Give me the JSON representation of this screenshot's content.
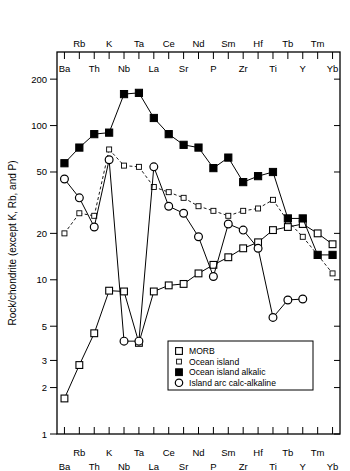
{
  "chart_data": {
    "type": "line",
    "title": "",
    "subtitle": "",
    "xlabel": "",
    "ylabel": "Rock/chondrite (except K, Rb, and P)",
    "yscale": "log",
    "ylim": [
      1,
      300
    ],
    "ytick_values": [
      1,
      2,
      3,
      5,
      10,
      20,
      50,
      100,
      200
    ],
    "ytick_labels": [
      "1",
      "2",
      "3",
      "5",
      "10",
      "20",
      "50",
      "100",
      "200"
    ],
    "grid": false,
    "legend_position": "bottom-right",
    "categories": [
      "Ba",
      "Rb",
      "Th",
      "K",
      "Nb",
      "Ta",
      "La",
      "Ce",
      "Sr",
      "Nd",
      "P",
      "Sm",
      "Zr",
      "Hf",
      "Ti",
      "Tb",
      "Y",
      "Tm",
      "Yb"
    ],
    "top_axis_labels": [
      "",
      "Rb",
      "",
      "K",
      "",
      "Ta",
      "",
      "Ce",
      "",
      "Nd",
      "",
      "Sm",
      "",
      "Hf",
      "",
      "Tb",
      "",
      "Tm",
      ""
    ],
    "bottom_axis_labels": [
      "Ba",
      "",
      "Th",
      "",
      "Nb",
      "",
      "La",
      "",
      "Sr",
      "",
      "P",
      "",
      "Zr",
      "",
      "Ti",
      "",
      "Y",
      "",
      "Yb"
    ],
    "series": [
      {
        "name": "MORB",
        "marker": "open-square",
        "line": "solid",
        "values": [
          1.7,
          2.8,
          4.5,
          8.5,
          8.4,
          3.9,
          8.4,
          9.2,
          9.4,
          11.0,
          12.5,
          14.0,
          16.0,
          17.5,
          21.0,
          22.0,
          23.0,
          20.0,
          17.0
        ]
      },
      {
        "name": "Ocean island",
        "marker": "small-open-square",
        "line": "dashed",
        "values": [
          20.0,
          27.0,
          26.0,
          70.0,
          55.0,
          54.0,
          40.0,
          37.0,
          34.0,
          30.0,
          28.0,
          26.0,
          28.0,
          29.0,
          33.0,
          24.0,
          19.0,
          14.5,
          11.0
        ]
      },
      {
        "name": "Ocean island alkalic",
        "marker": "filled-square",
        "line": "solid",
        "values": [
          57.0,
          72.0,
          88.0,
          90.0,
          160.0,
          163.0,
          112.0,
          88.0,
          75.0,
          72.0,
          53.0,
          62.0,
          43.0,
          47.0,
          50.0,
          25.0,
          25.0,
          14.5,
          14.5
        ]
      },
      {
        "name": "Island arc calc-alkaline",
        "marker": "open-circle",
        "line": "solid",
        "values": [
          45.0,
          34.0,
          22.0,
          60.0,
          4.0,
          4.0,
          54.0,
          30.0,
          27.0,
          19.0,
          10.5,
          23.0,
          21.0,
          16.0,
          5.7,
          7.4,
          7.5,
          null,
          null
        ]
      }
    ],
    "legend": [
      {
        "label": "MORB",
        "marker": "open-square"
      },
      {
        "label": "Ocean island",
        "marker": "small-open-square"
      },
      {
        "label": "Ocean island alkalic",
        "marker": "filled-square"
      },
      {
        "label": "Island arc calc-alkaline",
        "marker": "open-circle"
      }
    ],
    "colors": {
      "line": "#000000",
      "marker_fill": "#ffffff",
      "marker_stroke": "#000000",
      "filled_marker": "#000000",
      "background": "#ffffff"
    }
  }
}
